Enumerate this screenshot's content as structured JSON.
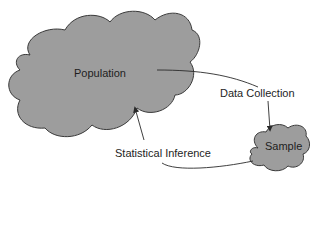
{
  "diagram": {
    "nodes": {
      "population": {
        "label": "Population",
        "shape": "cloud",
        "fill": "#9d9d9d"
      },
      "sample": {
        "label": "Sample",
        "shape": "cloud",
        "fill": "#9d9d9d"
      }
    },
    "edges": {
      "data_collection": {
        "label": "Data Collection",
        "from": "Population",
        "to": "Sample"
      },
      "statistical_inference": {
        "label": "Statistical Inference",
        "from": "Sample",
        "to": "Population"
      }
    },
    "colors": {
      "cloud_fill": "#9d9d9d",
      "outline": "#3a3a3a",
      "arrow": "#2a2a2a",
      "text": "#1e1e1e"
    }
  }
}
